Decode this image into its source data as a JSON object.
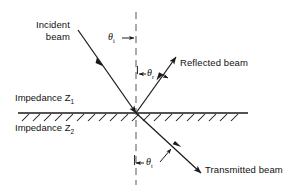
{
  "figure": {
    "type": "physics-ray-diagram",
    "background_color": "#ffffff",
    "line_color": "#1a1a1a"
  },
  "labels": {
    "incident_beam_line1": "Incident",
    "incident_beam_line2": "beam",
    "reflected_beam": "Reflected beam",
    "transmitted_beam": "Transmitted beam",
    "impedance_upper_text": "Impedance Z",
    "impedance_upper_sub": "1",
    "impedance_lower_text": "Impedance Z",
    "impedance_lower_sub": "2"
  },
  "angles": {
    "incident_symbol": "θ",
    "incident_sub": "i",
    "reflected_symbol": "θ",
    "reflected_sub": "r",
    "transmitted_symbol": "θ",
    "transmitted_sub": "t"
  },
  "geometry": {
    "origin_x": 136,
    "origin_y": 113,
    "interface_y": 113,
    "interface_x_start": 18,
    "interface_x_end": 248,
    "normal_x": 136,
    "normal_y_top": 12,
    "normal_y_bottom": 185,
    "incident_start_x": 78,
    "incident_start_y": 30,
    "reflected_end_x": 176,
    "reflected_end_y": 57,
    "transmitted_end_x": 201,
    "transmitted_end_y": 173
  }
}
